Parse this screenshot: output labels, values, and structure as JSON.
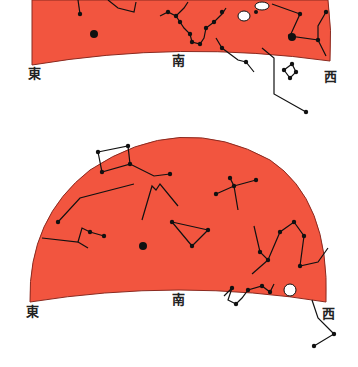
{
  "colors": {
    "sky": "#f2553f",
    "sky_edge": "#8a2a20",
    "star": "#111111",
    "background": "#ffffff"
  },
  "panels": [
    {
      "id": "top",
      "labels": {
        "east": "東",
        "south": "南",
        "west": "西"
      },
      "label_pos": {
        "east": [
          28,
          72
        ],
        "south": [
          172,
          58
        ],
        "west": [
          324,
          72
        ]
      },
      "sky_path": "M32,0 L328,0 Q332,30 330,61 Q180,40 32,65 Z",
      "constellations": [
        {
          "name": "top-left-1",
          "lines": [
            [
              [
                78,
                0
              ],
              [
                80,
                14
              ]
            ]
          ],
          "stars": [
            [
              80,
              14
            ]
          ]
        },
        {
          "name": "top-left-2",
          "lines": [
            [
              [
                108,
                0
              ],
              [
                118,
                8
              ],
              [
                134,
                12
              ],
              [
                136,
                2
              ]
            ]
          ],
          "stars": []
        },
        {
          "name": "scorpius-like",
          "lines": [
            [
              [
                160,
                16
              ],
              [
                168,
                12
              ],
              [
                176,
                16
              ],
              [
                184,
                8
              ],
              [
                188,
                2
              ]
            ],
            [
              [
                176,
                16
              ],
              [
                180,
                22
              ],
              [
                184,
                28
              ],
              [
                190,
                34
              ],
              [
                192,
                42
              ],
              [
                200,
                44
              ],
              [
                204,
                38
              ],
              [
                206,
                28
              ],
              [
                214,
                22
              ],
              [
                222,
                14
              ],
              [
                226,
                8
              ]
            ]
          ],
          "stars": [
            [
              168,
              12
            ],
            [
              176,
              16
            ],
            [
              180,
              22
            ],
            [
              190,
              34
            ],
            [
              192,
              42
            ],
            [
              200,
              44
            ],
            [
              206,
              28
            ],
            [
              214,
              22
            ],
            [
              222,
              12
            ]
          ]
        },
        {
          "name": "nebula-white",
          "lines": [],
          "stars": []
        },
        {
          "name": "right-1",
          "lines": [
            [
              [
                272,
                4
              ],
              [
                300,
                14
              ],
              [
                290,
                36
              ],
              [
                318,
                40
              ],
              [
                326,
                56
              ]
            ]
          ],
          "stars": [
            [
              300,
              14
            ],
            [
              290,
              36
            ],
            [
              318,
              40
            ]
          ]
        },
        {
          "name": "right-2",
          "lines": [
            [
              [
                326,
                12
              ],
              [
                318,
                26
              ],
              [
                318,
                40
              ]
            ]
          ],
          "stars": [
            [
              326,
              12
            ]
          ]
        },
        {
          "name": "center-bottom",
          "lines": [
            [
              [
                216,
                38
              ],
              [
                222,
                48
              ],
              [
                238,
                60
              ],
              [
                246,
                62
              ],
              [
                254,
                72
              ]
            ]
          ],
          "stars": [
            [
              222,
              48
            ],
            [
              246,
              62
            ]
          ]
        },
        {
          "name": "hanging",
          "lines": [
            [
              [
                262,
                48
              ],
              [
                274,
                58
              ],
              [
                274,
                94
              ],
              [
                306,
                112
              ]
            ]
          ],
          "stars": [
            [
              306,
              112
            ]
          ]
        },
        {
          "name": "small-quad",
          "lines": [
            [
              [
                284,
                70
              ],
              [
                292,
                64
              ],
              [
                296,
                72
              ],
              [
                290,
                78
              ],
              [
                284,
                70
              ]
            ]
          ],
          "stars": [
            [
              284,
              70
            ],
            [
              292,
              64
            ],
            [
              296,
              72
            ],
            [
              290,
              78
            ]
          ]
        }
      ],
      "bright_stars": [
        [
          94,
          34,
          4
        ],
        [
          292,
          37,
          4
        ]
      ]
    },
    {
      "id": "bottom",
      "labels": {
        "east": "東",
        "south": "南",
        "west": "西"
      },
      "label_pos": {
        "east": [
          26,
          308
        ],
        "south": [
          172,
          296
        ],
        "west": [
          322,
          310
        ]
      },
      "sky_path": "M30,302 Q28,218 90,170 Q180,110 270,160 Q330,200 326,302 Q180,278 30,302 Z",
      "constellations": [
        {
          "name": "pegasus-like",
          "lines": [
            [
              [
                98,
                152
              ],
              [
                128,
                146
              ],
              [
                130,
                164
              ],
              [
                102,
                172
              ],
              [
                98,
                152
              ]
            ],
            [
              [
                130,
                164
              ],
              [
                154,
                176
              ],
              [
                170,
                174
              ]
            ]
          ],
          "stars": [
            [
              98,
              152
            ],
            [
              128,
              146
            ],
            [
              130,
              164
            ],
            [
              102,
              172
            ],
            [
              170,
              174
            ]
          ]
        },
        {
          "name": "long-line",
          "lines": [
            [
              [
                58,
                222
              ],
              [
                80,
                198
              ],
              [
                134,
                184
              ]
            ]
          ],
          "stars": [
            [
              58,
              222
            ]
          ]
        },
        {
          "name": "cross-small",
          "lines": [
            [
              [
                42,
                238
              ],
              [
                78,
                242
              ],
              [
                82,
                228
              ],
              [
                90,
                232
              ],
              [
                104,
                236
              ]
            ],
            [
              [
                78,
                242
              ],
              [
                88,
                248
              ]
            ]
          ],
          "stars": [
            [
              90,
              232
            ],
            [
              104,
              236
            ]
          ]
        },
        {
          "name": "m-shape",
          "lines": [
            [
              [
                142,
                220
              ],
              [
                152,
                186
              ],
              [
                156,
                190
              ],
              [
                160,
                184
              ],
              [
                178,
                206
              ]
            ]
          ],
          "stars": []
        },
        {
          "name": "triangle",
          "lines": [
            [
              [
                172,
                222
              ],
              [
                208,
                230
              ],
              [
                192,
                246
              ],
              [
                172,
                222
              ]
            ]
          ],
          "stars": [
            [
              172,
              222
            ],
            [
              208,
              230
            ],
            [
              192,
              246
            ]
          ]
        },
        {
          "name": "cygnus-like",
          "lines": [
            [
              [
                216,
                194
              ],
              [
                234,
                186
              ],
              [
                256,
                180
              ]
            ],
            [
              [
                234,
                186
              ],
              [
                238,
                210
              ]
            ],
            [
              [
                230,
                178
              ],
              [
                234,
                186
              ]
            ]
          ],
          "stars": [
            [
              216,
              194
            ],
            [
              234,
              186
            ],
            [
              256,
              180
            ],
            [
              230,
              178
            ]
          ]
        },
        {
          "name": "right-tall",
          "lines": [
            [
              [
                254,
                226
              ],
              [
                260,
                252
              ],
              [
                268,
                260
              ],
              [
                280,
                232
              ],
              [
                294,
                222
              ],
              [
                304,
                236
              ],
              [
                300,
                266
              ],
              [
                318,
                262
              ],
              [
                328,
                248
              ]
            ],
            [
              [
                268,
                260
              ],
              [
                252,
                274
              ]
            ]
          ],
          "stars": [
            [
              260,
              252
            ],
            [
              268,
              260
            ],
            [
              280,
              232
            ],
            [
              294,
              222
            ],
            [
              304,
              236
            ],
            [
              300,
              266
            ]
          ]
        },
        {
          "name": "scorpius-like",
          "lines": [
            [
              [
                224,
                296
              ],
              [
                232,
                288
              ],
              [
                228,
                300
              ],
              [
                236,
                304
              ],
              [
                242,
                298
              ],
              [
                248,
                290
              ],
              [
                262,
                286
              ],
              [
                270,
                292
              ],
              [
                274,
                284
              ]
            ]
          ],
          "stars": [
            [
              232,
              288
            ],
            [
              236,
              304
            ],
            [
              248,
              290
            ],
            [
              262,
              286
            ],
            [
              270,
              292
            ]
          ]
        },
        {
          "name": "hanging",
          "lines": [
            [
              [
                312,
                300
              ],
              [
                318,
                318
              ],
              [
                334,
                334
              ],
              [
                314,
                346
              ]
            ]
          ],
          "stars": [
            [
              334,
              334
            ],
            [
              314,
              346
            ]
          ]
        }
      ],
      "bright_stars": [
        [
          143,
          246,
          4
        ]
      ],
      "nebula": [
        [
          290,
          290,
          6
        ]
      ]
    }
  ]
}
